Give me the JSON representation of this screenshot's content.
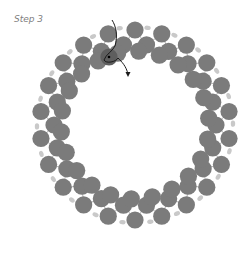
{
  "step_label": "Step 3",
  "colors": {
    "bead": "#7b7b7b",
    "bead_highlight": "#5e5e5e",
    "seed_bead": "#c9c9c9",
    "thread": "#a0a0a0",
    "active_thread": "#1a1a1a",
    "background": "#ffffff"
  },
  "ring": {
    "cx": 135,
    "cy": 125,
    "count": 22,
    "outer_radius": 95,
    "inner_radius": 74,
    "bead_radius": 8.6,
    "seed_radius": 92,
    "gap_start_deg": -100,
    "gap_end_deg": -78
  },
  "highlight_bead": {
    "x": 109,
    "y": 57
  },
  "active_thread_path": "M112 20 C116 26 118 36 115 46 C112 52 106 54 104 60 C106 64 116 62 118 58 C122 62 126 66 128 74"
}
